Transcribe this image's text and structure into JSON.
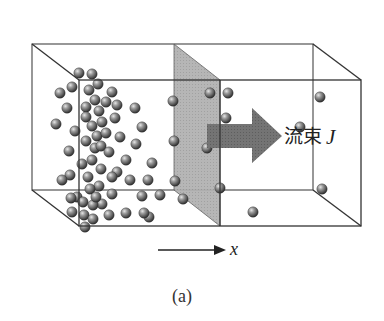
{
  "figure": {
    "caption": "(a)",
    "flux_label": "流束",
    "flux_symbol": "J",
    "axis_label": "x"
  },
  "colors": {
    "box_edge": "#333333",
    "plane_fill": "#a8a8a8",
    "arrow_fill": "#707070",
    "particle_light": "#c8c8c8",
    "particle_dark": "#3a3a3a"
  },
  "box": {
    "back_top_left": [
      32,
      44
    ],
    "back_top_right": [
      313,
      44
    ],
    "back_bottom_left": [
      32,
      190
    ],
    "back_bottom_right": [
      313,
      190
    ],
    "front_top_left": [
      79,
      80
    ],
    "front_top_right": [
      361,
      80
    ],
    "front_bottom_left": [
      79,
      226
    ],
    "front_bottom_right": [
      361,
      226
    ]
  },
  "plane": {
    "points": [
      [
        174,
        44
      ],
      [
        220,
        80
      ],
      [
        220,
        226
      ],
      [
        174,
        190
      ]
    ]
  },
  "arrow": {
    "points": [
      [
        207,
        124
      ],
      [
        252,
        124
      ],
      [
        252,
        108
      ],
      [
        282,
        136
      ],
      [
        252,
        163
      ],
      [
        252,
        148
      ],
      [
        207,
        148
      ]
    ]
  },
  "axis_arrow": {
    "x1": 158,
    "x2": 222,
    "y": 250
  },
  "particles": [
    [
      79,
      73
    ],
    [
      92,
      74
    ],
    [
      72,
      87
    ],
    [
      98,
      84
    ],
    [
      60,
      93
    ],
    [
      89,
      90
    ],
    [
      112,
      92
    ],
    [
      67,
      108
    ],
    [
      86,
      107
    ],
    [
      95,
      100
    ],
    [
      106,
      102
    ],
    [
      117,
      105
    ],
    [
      135,
      108
    ],
    [
      86,
      117
    ],
    [
      99,
      111
    ],
    [
      115,
      118
    ],
    [
      56,
      124
    ],
    [
      75,
      131
    ],
    [
      92,
      126
    ],
    [
      102,
      122
    ],
    [
      142,
      127
    ],
    [
      86,
      141
    ],
    [
      97,
      136
    ],
    [
      106,
      133
    ],
    [
      120,
      137
    ],
    [
      69,
      151
    ],
    [
      95,
      148
    ],
    [
      101,
      146
    ],
    [
      136,
      144
    ],
    [
      82,
      164
    ],
    [
      92,
      160
    ],
    [
      109,
      152
    ],
    [
      117,
      172
    ],
    [
      70,
      175
    ],
    [
      101,
      169
    ],
    [
      88,
      177
    ],
    [
      130,
      180
    ],
    [
      152,
      163
    ],
    [
      99,
      186
    ],
    [
      77,
      197
    ],
    [
      90,
      189
    ],
    [
      112,
      194
    ],
    [
      72,
      212
    ],
    [
      84,
      215
    ],
    [
      102,
      204
    ],
    [
      93,
      219
    ],
    [
      126,
      213
    ],
    [
      149,
      217
    ],
    [
      142,
      196
    ],
    [
      109,
      215
    ],
    [
      83,
      202
    ],
    [
      93,
      205
    ],
    [
      85,
      227
    ],
    [
      71,
      198
    ],
    [
      62,
      180
    ],
    [
      148,
      180
    ],
    [
      173,
      101
    ],
    [
      174,
      141
    ],
    [
      210,
      93
    ],
    [
      207,
      148
    ],
    [
      175,
      181
    ],
    [
      220,
      188
    ],
    [
      183,
      199
    ],
    [
      228,
      93
    ],
    [
      239,
      135
    ],
    [
      226,
      118
    ],
    [
      300,
      127
    ],
    [
      320,
      97
    ],
    [
      322,
      189
    ],
    [
      253,
      212
    ],
    [
      112,
      177
    ],
    [
      126,
      160
    ],
    [
      96,
      197
    ],
    [
      144,
      213
    ],
    [
      160,
      195
    ]
  ]
}
